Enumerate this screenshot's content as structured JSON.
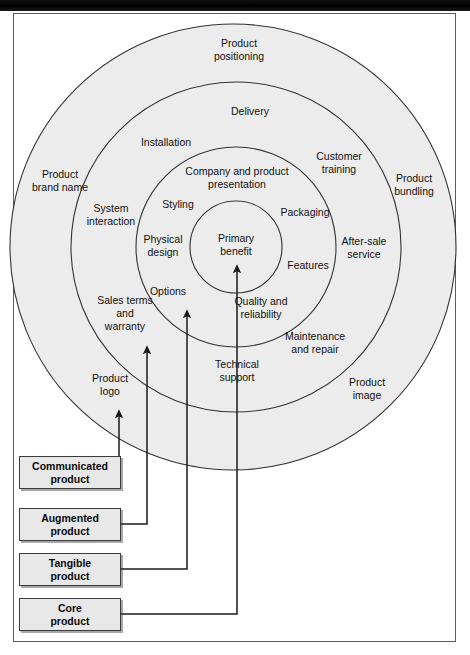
{
  "figure": {
    "frame_color": "#5d5d5d",
    "ring_fill": "#ececec",
    "ring_stroke": "#333333"
  },
  "rings": [
    {
      "id": "core",
      "label": "Core product",
      "radius": 46,
      "cx": 236,
      "cy": 247
    },
    {
      "id": "tangible",
      "label": "Tangible product",
      "radius": 100,
      "cx": 236,
      "cy": 247
    },
    {
      "id": "augmented",
      "label": "Augmented product",
      "radius": 165,
      "cx": 236,
      "cy": 247
    },
    {
      "id": "communicated",
      "label": "Communicated product",
      "radius": 223,
      "cx": 233,
      "cy": 247
    }
  ],
  "labels": {
    "core": [
      {
        "text": "Primary",
        "x": 236,
        "y": 242
      },
      {
        "text": "benefit",
        "x": 236,
        "y": 255
      }
    ],
    "tangible": [
      {
        "text": "Company and product",
        "x": 237,
        "y": 175
      },
      {
        "text": "presentation",
        "x": 237,
        "y": 188
      },
      {
        "text": "Styling",
        "x": 178,
        "y": 208
      },
      {
        "text": "Packaging",
        "x": 305,
        "y": 216
      },
      {
        "text": "Physical",
        "x": 163,
        "y": 243
      },
      {
        "text": "design",
        "x": 163,
        "y": 256
      },
      {
        "text": "Features",
        "x": 308,
        "y": 269
      },
      {
        "text": "Options",
        "x": 168,
        "y": 295
      },
      {
        "text": "Quality and",
        "x": 261,
        "y": 305
      },
      {
        "text": "reliability",
        "x": 261,
        "y": 318
      }
    ],
    "augmented": [
      {
        "text": "Delivery",
        "x": 250,
        "y": 115
      },
      {
        "text": "Installation",
        "x": 166,
        "y": 146
      },
      {
        "text": "Customer",
        "x": 339,
        "y": 160
      },
      {
        "text": "training",
        "x": 339,
        "y": 173
      },
      {
        "text": "System",
        "x": 111,
        "y": 212
      },
      {
        "text": "interaction",
        "x": 111,
        "y": 225
      },
      {
        "text": "After-sale",
        "x": 364,
        "y": 245
      },
      {
        "text": "service",
        "x": 364,
        "y": 258
      },
      {
        "text": "Sales terms",
        "x": 125,
        "y": 304
      },
      {
        "text": "and",
        "x": 125,
        "y": 317
      },
      {
        "text": "warranty",
        "x": 125,
        "y": 330
      },
      {
        "text": "Maintenance",
        "x": 315,
        "y": 340
      },
      {
        "text": "and repair",
        "x": 315,
        "y": 353
      },
      {
        "text": "Technical",
        "x": 237,
        "y": 368
      },
      {
        "text": "support",
        "x": 237,
        "y": 381
      }
    ],
    "communicated": [
      {
        "text": "Product",
        "x": 239,
        "y": 47
      },
      {
        "text": "positioning",
        "x": 239,
        "y": 60
      },
      {
        "text": "Product",
        "x": 60,
        "y": 178
      },
      {
        "text": "brand name",
        "x": 60,
        "y": 191
      },
      {
        "text": "Product",
        "x": 414,
        "y": 182
      },
      {
        "text": "bundling",
        "x": 414,
        "y": 195
      },
      {
        "text": "Product",
        "x": 110,
        "y": 382
      },
      {
        "text": "logo",
        "x": 110,
        "y": 395
      },
      {
        "text": "Product",
        "x": 367,
        "y": 386
      },
      {
        "text": "image",
        "x": 367,
        "y": 399
      }
    ]
  },
  "legend": [
    {
      "id": "communicated",
      "line1": "Communicated",
      "line2": "product",
      "x": 19,
      "y": 456,
      "w": 102,
      "h": 33
    },
    {
      "id": "augmented",
      "line1": "Augmented",
      "line2": "product",
      "x": 19,
      "y": 508,
      "w": 102,
      "h": 33
    },
    {
      "id": "tangible",
      "line1": "Tangible",
      "line2": "product",
      "x": 19,
      "y": 553,
      "w": 102,
      "h": 33
    },
    {
      "id": "core",
      "line1": "Core",
      "line2": "product",
      "x": 19,
      "y": 598,
      "w": 102,
      "h": 33
    }
  ],
  "connectors": [
    {
      "id": "communicated-arrow",
      "arrow_x": 119,
      "tip_y": 408,
      "box_right": 121,
      "box_mid_y": 472,
      "elbow_x": 119
    },
    {
      "id": "augmented-arrow",
      "arrow_x": 147,
      "tip_y": 344,
      "box_right": 121,
      "box_mid_y": 524,
      "elbow_x": 147
    },
    {
      "id": "tangible-arrow",
      "arrow_x": 187,
      "tip_y": 308,
      "box_right": 121,
      "box_mid_y": 569,
      "elbow_x": 187
    },
    {
      "id": "core-arrow",
      "arrow_x": 237,
      "tip_y": 263,
      "box_right": 121,
      "box_mid_y": 614,
      "elbow_x": 237
    }
  ]
}
